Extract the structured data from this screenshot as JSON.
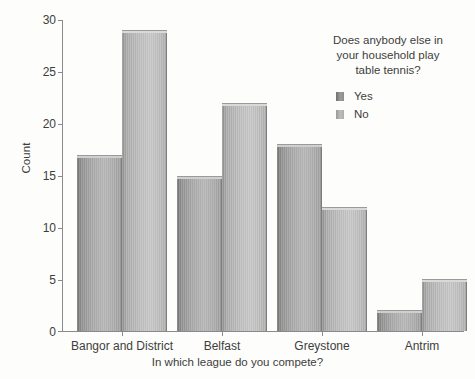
{
  "chart_data": {
    "type": "bar",
    "title": "",
    "categories": [
      "Bangor and District",
      "Belfast",
      "Greystone",
      "Antrim"
    ],
    "series": [
      {
        "name": "Yes",
        "values": [
          17,
          15,
          18,
          2
        ],
        "color": "#9c9c9c"
      },
      {
        "name": "No",
        "values": [
          29,
          22,
          12,
          5
        ],
        "color": "#bdbdbd"
      }
    ],
    "xlabel": "In which league do you compete?",
    "ylabel": "Count",
    "ylim": [
      0,
      30
    ],
    "yticks": [
      0,
      5,
      10,
      15,
      20,
      25,
      30
    ],
    "grid": false,
    "legend_position": "top-right",
    "legend_title": "Does anybody else in your household play table tennis?"
  },
  "axes": {
    "y_title": "Count",
    "x_title": "In which league do you compete?",
    "y_tick_labels": [
      "30",
      "25",
      "20",
      "15",
      "10",
      "5",
      "0"
    ]
  },
  "legend": {
    "title_lines": [
      "Does anybody else in",
      "your household play",
      "table tennis?"
    ],
    "entries": [
      {
        "label": "Yes"
      },
      {
        "label": "No"
      }
    ]
  }
}
